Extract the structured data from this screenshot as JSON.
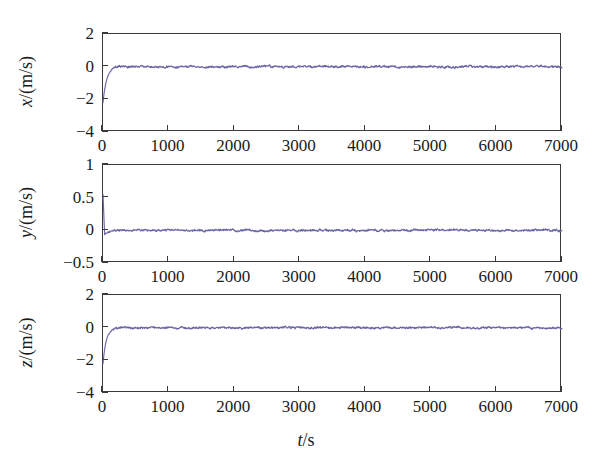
{
  "figure": {
    "width": 612,
    "height": 463,
    "background": "#ffffff",
    "line_color": "#6a66a6",
    "axis_color": "#3a3a3a"
  },
  "xlabel": "t/s",
  "xlabel_italic": "t",
  "xlabel_rest": "/s",
  "chart_data": [
    {
      "type": "line",
      "title": "",
      "panel_index": 0,
      "ylabel": "x/(m/s)",
      "ylabel_italic": "x",
      "ylabel_rest": "/(m/s)",
      "xlabel": "",
      "xlim": [
        0,
        7000
      ],
      "ylim": [
        -4,
        2
      ],
      "xticks": [
        0,
        1000,
        2000,
        3000,
        4000,
        5000,
        6000,
        7000
      ],
      "xticklabels": [
        "0",
        "1000",
        "2000",
        "3000",
        "4000",
        "5000",
        "6000",
        "7000"
      ],
      "yticks": [
        2,
        0,
        -2,
        -4
      ],
      "yticklabels": [
        "2",
        "0",
        "-2",
        "-4"
      ],
      "grid": false,
      "legend": "none",
      "series": [
        {
          "name": "x velocity error",
          "color": "#6a66a6",
          "initial_value": -2.2,
          "settle_value": 0.0,
          "settle_time": 180,
          "noise_amplitude": 0.09,
          "description": "Starts near -2.2 m/s, rises steeply to ~0 within ~180 s, then oscillates about 0 with small-amplitude noise through 7000 s"
        }
      ]
    },
    {
      "type": "line",
      "title": "",
      "panel_index": 1,
      "ylabel": "y/(m/s)",
      "ylabel_italic": "y",
      "ylabel_rest": "/(m/s)",
      "xlabel": "",
      "xlim": [
        0,
        7000
      ],
      "ylim": [
        -0.5,
        1
      ],
      "xticks": [
        0,
        1000,
        2000,
        3000,
        4000,
        5000,
        6000,
        7000
      ],
      "xticklabels": [
        "0",
        "1000",
        "2000",
        "3000",
        "4000",
        "5000",
        "6000",
        "7000"
      ],
      "yticks": [
        1,
        0.5,
        0,
        -0.5
      ],
      "yticklabels": [
        "1",
        "0.5",
        "0",
        "-0.5"
      ],
      "grid": false,
      "legend": "none",
      "series": [
        {
          "name": "y velocity error",
          "color": "#6a66a6",
          "initial_value": 0.55,
          "settle_value": 0.0,
          "settle_time": 120,
          "undershoot_value": -0.07,
          "noise_amplitude": 0.022,
          "description": "Spikes up to ~0.55 m/s at t=0, drops through a small undershoot near -0.07, then settles on 0 with low-amplitude noise"
        }
      ]
    },
    {
      "type": "line",
      "title": "",
      "panel_index": 2,
      "ylabel": "z/(m/s)",
      "ylabel_italic": "z",
      "ylabel_rest": "/(m/s)",
      "xlabel": "t/s",
      "xlim": [
        0,
        7000
      ],
      "ylim": [
        -4,
        2
      ],
      "xticks": [
        0,
        1000,
        2000,
        3000,
        4000,
        5000,
        6000,
        7000
      ],
      "xticklabels": [
        "0",
        "1000",
        "2000",
        "3000",
        "4000",
        "5000",
        "6000",
        "7000"
      ],
      "yticks": [
        2,
        0,
        -2,
        -4
      ],
      "yticklabels": [
        "2",
        "0",
        "-2",
        "-4"
      ],
      "grid": false,
      "legend": "none",
      "series": [
        {
          "name": "z velocity error",
          "color": "#6a66a6",
          "initial_value": -2.2,
          "settle_value": 0.0,
          "settle_time": 160,
          "noise_amplitude": 0.085,
          "description": "Starts near -2.2 m/s, converges quickly to ~0 within ~160 s and stays flat with small ripple to 7000 s"
        }
      ]
    }
  ]
}
